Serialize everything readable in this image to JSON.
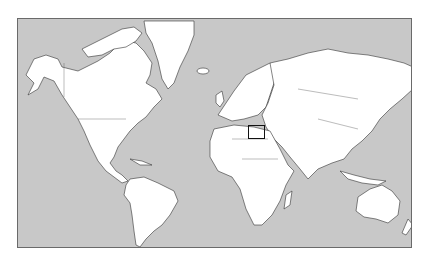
{
  "map": {
    "projection": "Mercator world map",
    "ocean_color": "#c8c8c8",
    "land_color": "#ffffff",
    "frame_color": "#6a6a6a",
    "highlight": {
      "region": "Eastern Mediterranean / Levant",
      "box_color": "#111111"
    },
    "continents": [
      "North America",
      "South America",
      "Greenland",
      "Europe",
      "Africa",
      "Asia",
      "Australia",
      "New Zealand"
    ]
  }
}
